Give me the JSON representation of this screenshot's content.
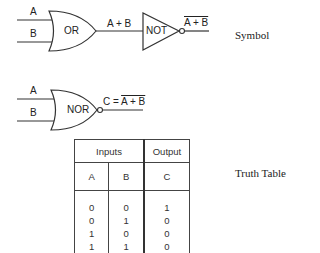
{
  "or_gate": {
    "input_a": "A",
    "input_b": "B",
    "gate_label": "OR",
    "output_label": "A + B"
  },
  "not_gate": {
    "gate_label": "NOT",
    "output_label": "A + B",
    "output_overlined": true
  },
  "symbol_caption": "Symbol",
  "nor_gate": {
    "input_a": "A",
    "input_b": "B",
    "gate_label": "NOR",
    "output_prefix": "C = ",
    "output_expr": "A + B",
    "output_overlined": true
  },
  "truth_table": {
    "caption": "Truth Table",
    "group_headers": [
      "Inputs",
      "Output"
    ],
    "columns": [
      "A",
      "B",
      "C"
    ],
    "rows": [
      [
        "0",
        "0",
        "1"
      ],
      [
        "0",
        "1",
        "0"
      ],
      [
        "1",
        "0",
        "0"
      ],
      [
        "1",
        "1",
        "0"
      ]
    ]
  }
}
